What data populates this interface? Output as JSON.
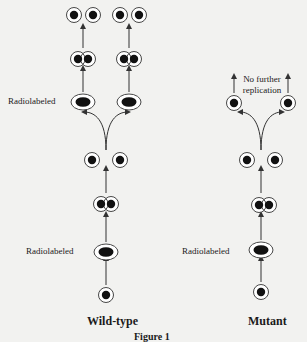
{
  "figure": {
    "panels": [
      {
        "title": "Wild-type",
        "labels": {
          "radiolabeled_upper": "Radiolabeled",
          "radiolabeled_lower": "Radiolabeled"
        },
        "stages": [
          "single cell",
          "radiolabeled doublet",
          "paired cells",
          "separated pair",
          "two radiolabeled doublets",
          "two paired cells",
          "four separated cells"
        ]
      },
      {
        "title": "Mutant",
        "labels": {
          "radiolabeled_lower": "Radiolabeled",
          "note_line1": "No further",
          "note_line2": "replication"
        },
        "stages": [
          "single cell",
          "radiolabeled doublet",
          "paired cells",
          "separated pair",
          "two single cells (no further replication)"
        ]
      }
    ],
    "caption": "Figure 1"
  }
}
